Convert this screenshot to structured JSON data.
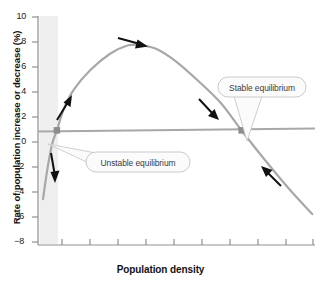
{
  "chart_data": {
    "type": "line",
    "title": "",
    "xlabel": "Population density",
    "ylabel": "Rate of population increase or decrease (%)",
    "ylim": [
      -10,
      10
    ],
    "xlim": [
      0,
      10
    ],
    "grid": false,
    "legend": null,
    "y_ticks": [
      {
        "label": "10",
        "value": 10
      },
      {
        "label": "8",
        "value": 8
      },
      {
        "label": "6",
        "value": 6
      },
      {
        "label": "4",
        "value": 4
      },
      {
        "label": "2",
        "value": 2
      },
      {
        "label": "0",
        "value": 0
      },
      {
        "label": "−2",
        "value": -2
      },
      {
        "label": "−4",
        "value": -4
      },
      {
        "label": "−6",
        "value": -6
      },
      {
        "label": "−8",
        "value": -8
      }
    ],
    "x_ticks_labeled": false,
    "x_tick_count": 10,
    "series": [
      {
        "name": "Population growth rate curve",
        "color": "#a8a8a8",
        "points": [
          [
            0.18,
            -6.0
          ],
          [
            0.35,
            -3.2
          ],
          [
            0.52,
            -1.1
          ],
          [
            0.68,
            0.0
          ],
          [
            0.95,
            2.0
          ],
          [
            1.3,
            3.6
          ],
          [
            1.9,
            5.3
          ],
          [
            2.6,
            6.7
          ],
          [
            3.2,
            7.4
          ],
          [
            3.7,
            7.5
          ],
          [
            4.3,
            7.1
          ],
          [
            5.0,
            6.0
          ],
          [
            5.8,
            4.3
          ],
          [
            6.6,
            2.4
          ],
          [
            7.35,
            0.0
          ],
          [
            8.2,
            -2.6
          ],
          [
            9.1,
            -5.2
          ],
          [
            9.9,
            -7.3
          ]
        ]
      },
      {
        "name": "Zero growth reference line",
        "color": "#a8a8a8",
        "points": [
          [
            0.0,
            0.0
          ],
          [
            10.0,
            0.0
          ]
        ]
      }
    ],
    "shaded_band": {
      "label": "low density region",
      "x_start": 0.05,
      "x_end": 0.72,
      "color": "#efefef"
    },
    "equilibria": [
      {
        "name": "unstable",
        "x": 0.68,
        "y": 0.0
      },
      {
        "name": "stable",
        "x": 7.35,
        "y": 0.0
      }
    ],
    "annotations": [
      {
        "name": "unstable-equilibrium-callout",
        "text": "Unstable equilibrium",
        "points_to": {
          "x": 0.68,
          "y": 0.0
        }
      },
      {
        "name": "stable-equilibrium-callout",
        "text": "Stable equilibrium",
        "points_to": {
          "x": 7.35,
          "y": 0.0
        }
      }
    ],
    "direction_arrows": [
      {
        "name": "arrow-down-below-unstable",
        "direction": "down",
        "meaning": "population declines below unstable equilibrium"
      },
      {
        "name": "arrow-up-above-unstable",
        "direction": "up-right",
        "meaning": "population grows above unstable equilibrium"
      },
      {
        "name": "arrow-right-at-peak",
        "direction": "right",
        "meaning": "population increases toward stable equilibrium"
      },
      {
        "name": "arrow-down-right-toward-stable",
        "direction": "down-right",
        "meaning": "growth rate falls toward stable equilibrium"
      },
      {
        "name": "arrow-up-left-toward-stable",
        "direction": "up-left",
        "meaning": "population returns to stable equilibrium"
      }
    ]
  }
}
